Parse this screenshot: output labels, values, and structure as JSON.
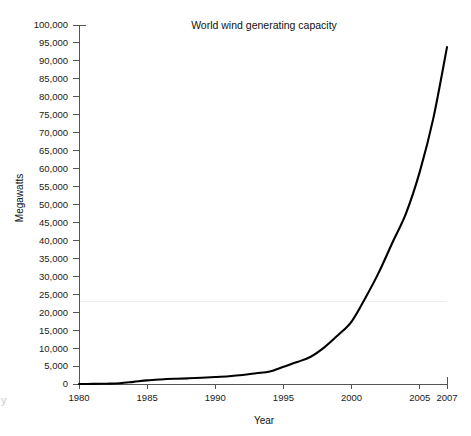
{
  "chart_data": {
    "type": "line",
    "title": "World wind generating capacity",
    "xlabel": "Year",
    "ylabel": "Megawatts",
    "grid": false,
    "legend": "none",
    "line_color": "#000000",
    "x": [
      1980,
      1981,
      1982,
      1983,
      1984,
      1985,
      1986,
      1987,
      1988,
      1989,
      1990,
      1991,
      1992,
      1993,
      1994,
      1995,
      1996,
      1997,
      1998,
      1999,
      2000,
      2001,
      2002,
      2003,
      2004,
      2005,
      2006,
      2007
    ],
    "values": [
      10,
      25,
      90,
      210,
      600,
      1020,
      1270,
      1450,
      1580,
      1730,
      1930,
      2170,
      2510,
      2990,
      3490,
      4800,
      6100,
      7600,
      10200,
      13600,
      17400,
      23900,
      31100,
      39431,
      47620,
      59091,
      74052,
      93849
    ],
    "ylim": [
      0,
      100000
    ],
    "xlim": [
      1980,
      2007
    ],
    "y_ticks": [
      0,
      5000,
      10000,
      15000,
      20000,
      25000,
      30000,
      35000,
      40000,
      45000,
      50000,
      55000,
      60000,
      65000,
      70000,
      75000,
      80000,
      85000,
      90000,
      95000,
      100000
    ],
    "y_tick_labels": [
      "0",
      "5,000",
      "10,000",
      "15,000",
      "20,000",
      "25,000",
      "30,000",
      "35,000",
      "40,000",
      "45,000",
      "50,000",
      "55,000",
      "60,000",
      "65,000",
      "70,000",
      "75,000",
      "80,000",
      "85,000",
      "90,000",
      "95,000",
      "100,000"
    ],
    "x_ticks": [
      1980,
      1985,
      1990,
      1995,
      2000,
      2005,
      2007
    ],
    "x_tick_labels": [
      "1980",
      "1985",
      "1990",
      "1995",
      "2000",
      "2005",
      "2007"
    ],
    "axis_color": "#555555",
    "text_color": "#111111"
  },
  "artifacts": {
    "corner_glyph": "y"
  }
}
